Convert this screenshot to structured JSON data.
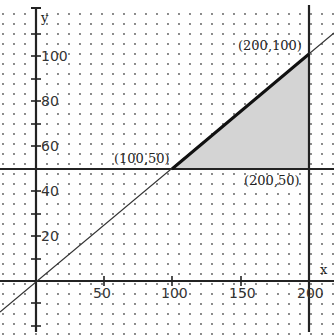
{
  "figure": {
    "type": "linear-programming-feasible-region",
    "axis_labels": {
      "x": "x",
      "y": "y"
    },
    "x_ticks": [
      {
        "value": 50,
        "label": "50"
      },
      {
        "value": 100,
        "label": "100"
      },
      {
        "value": 150,
        "label": "150"
      },
      {
        "value": 200,
        "label": "200"
      }
    ],
    "y_ticks": [
      {
        "value": 20,
        "label": "20"
      },
      {
        "value": 40,
        "label": "40"
      },
      {
        "value": 60,
        "label": "60"
      },
      {
        "value": 80,
        "label": "80"
      },
      {
        "value": 100,
        "label": "100"
      }
    ],
    "lines": [
      {
        "equation": "y = x/2"
      },
      {
        "equation": "y = 50"
      },
      {
        "equation": "x = 200"
      }
    ],
    "vertices": [
      {
        "label": "(100,50)",
        "x": 100,
        "y": 50
      },
      {
        "label": "(200,100)",
        "x": 200,
        "y": 100
      },
      {
        "label": "(200,50)",
        "x": 200,
        "y": 50
      }
    ],
    "colors": {
      "region_fill": "#d4d4d4",
      "line": "#1a1a1a",
      "dots": "#555555"
    }
  }
}
